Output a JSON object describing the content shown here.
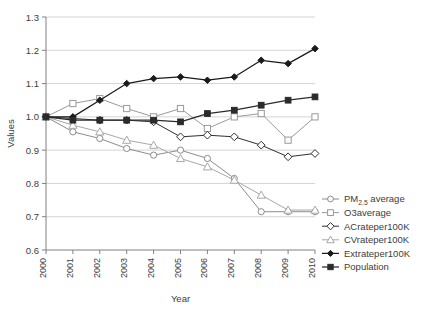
{
  "chart_data": {
    "type": "line",
    "title": "",
    "xlabel": "Year",
    "ylabel": "Values",
    "categories": [
      2000,
      2001,
      2002,
      2003,
      2004,
      2005,
      2006,
      2007,
      2008,
      2009,
      2010
    ],
    "x": [
      "2000",
      "2001",
      "2002",
      "2003",
      "2004",
      "2005",
      "2006",
      "2007",
      "2008",
      "2009",
      "2010"
    ],
    "xlim": [
      2000,
      2010
    ],
    "ylim": [
      0.6,
      1.3
    ],
    "yticks": [
      "0.6",
      "0.7",
      "0.8",
      "0.9",
      "1.0",
      "1.1",
      "1.2",
      "1.3"
    ],
    "ytick_values": [
      0.6,
      0.7,
      0.8,
      0.9,
      1.0,
      1.1,
      1.2,
      1.3
    ],
    "grid": "horizontal",
    "legend_position": "right",
    "series": [
      {
        "name": "PM2.5 average",
        "label": "PM",
        "label_sub": "2.5",
        "label_tail": " average",
        "marker": "open-circle",
        "color": "#8c8c8c",
        "values": [
          1.0,
          0.955,
          0.935,
          0.905,
          0.885,
          0.9,
          0.875,
          0.815,
          0.715,
          0.715,
          0.715
        ]
      },
      {
        "name": "O3average",
        "label": "O3average",
        "marker": "open-square",
        "color": "#9a9a9a",
        "values": [
          1.0,
          1.04,
          1.055,
          1.025,
          1.0,
          1.025,
          0.965,
          1.0,
          1.01,
          0.93,
          1.0
        ]
      },
      {
        "name": "ACrateper100K",
        "label": "ACrateper100K",
        "marker": "open-diamond",
        "color": "#2f2f2f",
        "values": [
          1.0,
          0.995,
          0.99,
          0.99,
          0.985,
          0.94,
          0.945,
          0.94,
          0.915,
          0.88,
          0.89
        ]
      },
      {
        "name": "CVrateper100K",
        "label": "CVrateper100K",
        "marker": "open-triangle",
        "color": "#a8a8a8",
        "values": [
          1.0,
          0.975,
          0.955,
          0.93,
          0.915,
          0.875,
          0.85,
          0.81,
          0.765,
          0.72,
          0.72
        ]
      },
      {
        "name": "Extrateper100K",
        "label": "Extrateper100K",
        "marker": "filled-diamond",
        "color": "#1a1a1a",
        "values": [
          1.0,
          1.0,
          1.05,
          1.1,
          1.115,
          1.12,
          1.11,
          1.12,
          1.17,
          1.16,
          1.205
        ]
      },
      {
        "name": "Population",
        "label": "Population",
        "marker": "filled-square",
        "color": "#2b2b2b",
        "values": [
          1.0,
          0.99,
          0.99,
          0.99,
          0.99,
          0.985,
          1.01,
          1.02,
          1.035,
          1.05,
          1.06
        ]
      }
    ]
  }
}
